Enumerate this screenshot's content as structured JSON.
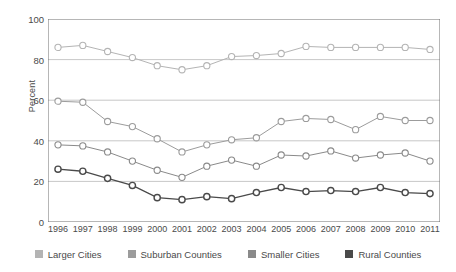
{
  "chart_data": {
    "type": "line",
    "title": "",
    "xlabel": "",
    "ylabel": "Percent",
    "ylim": [
      0,
      100
    ],
    "yticks": [
      0,
      20,
      40,
      60,
      80,
      100
    ],
    "grid": true,
    "legend_position": "bottom",
    "marker": "open-circle",
    "categories": [
      "1996",
      "1997",
      "1998",
      "1999",
      "2000",
      "2001",
      "2002",
      "2003",
      "2004",
      "2005",
      "2006",
      "2007",
      "2008",
      "2009",
      "2010",
      "2011"
    ],
    "series": [
      {
        "name": "Larger Cities",
        "color": "#b4b4b4",
        "values": [
          86,
          87,
          84,
          81,
          77,
          75,
          77,
          81.5,
          82,
          83,
          86.5,
          86,
          86,
          86,
          86,
          85
        ]
      },
      {
        "name": "Suburban Counties",
        "color": "#9c9c9c",
        "values": [
          59.5,
          59,
          49.5,
          47,
          41,
          34.5,
          38,
          40.5,
          41.5,
          49.5,
          51,
          50.5,
          45.5,
          52,
          50,
          50
        ]
      },
      {
        "name": "Smaller Cities",
        "color": "#8a8a8a",
        "values": [
          38,
          37.5,
          34.5,
          30,
          25.5,
          22,
          27.5,
          30.5,
          27.5,
          33,
          32.5,
          35,
          31.5,
          33,
          34,
          30
        ]
      },
      {
        "name": "Rural Counties",
        "color": "#4a4a4a",
        "values": [
          26,
          25,
          21.5,
          18,
          12,
          11,
          12.5,
          11.5,
          14.5,
          17,
          15,
          15.5,
          15,
          17,
          14.5,
          14
        ]
      }
    ]
  },
  "legend": {
    "items": [
      {
        "label": "Larger Cities",
        "color": "#b4b4b4"
      },
      {
        "label": "Suburban Counties",
        "color": "#9c9c9c"
      },
      {
        "label": "Smaller Cities",
        "color": "#8a8a8a"
      },
      {
        "label": "Rural Counties",
        "color": "#4a4a4a"
      }
    ]
  }
}
